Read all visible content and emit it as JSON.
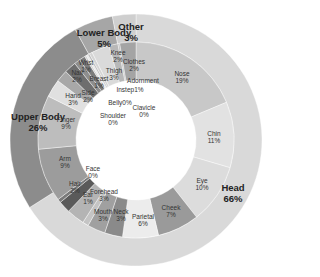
{
  "chart_data": {
    "type": "sunburst",
    "title": "",
    "start_angle_deg": 0,
    "direction": "clockwise",
    "outer": [
      {
        "name": "Head",
        "value": 66,
        "label": "66%",
        "color": "#d9d9d9"
      },
      {
        "name": "Upper Body",
        "value": 26,
        "label": "26%",
        "color": "#8c8c8c"
      },
      {
        "name": "Lower Body",
        "value": 5,
        "label": "5%",
        "color": "#a6a6a6"
      },
      {
        "name": "Other",
        "value": 3,
        "label": "3%",
        "color": "#cfcfcf"
      }
    ],
    "inner": [
      {
        "name": "Nose",
        "value": 19,
        "label": "19%",
        "parent": "Head",
        "color": "#c8c8c8"
      },
      {
        "name": "Chin",
        "value": 11,
        "label": "11%",
        "parent": "Head",
        "color": "#e2e2e2"
      },
      {
        "name": "Eye",
        "value": 10,
        "label": "10%",
        "parent": "Head",
        "color": "#dcdcdc"
      },
      {
        "name": "Cheek",
        "value": 7,
        "label": "7%",
        "parent": "Head",
        "color": "#9a9a9a"
      },
      {
        "name": "Parietal",
        "value": 6,
        "label": "6%",
        "parent": "Head",
        "color": "#ececec"
      },
      {
        "name": "Neck",
        "value": 3,
        "label": "3%",
        "parent": "Head",
        "color": "#8a8a8a"
      },
      {
        "name": "Mouth",
        "value": 3,
        "label": "3%",
        "parent": "Head",
        "color": "#a0a0a0"
      },
      {
        "name": "Ear",
        "value": 1,
        "label": "1%",
        "parent": "Head",
        "color": "#c4c4c4"
      },
      {
        "name": "Forehead",
        "value": 3,
        "label": "3%",
        "parent": "Head",
        "color": "#b4b4b4"
      },
      {
        "name": "Hair",
        "value": 2,
        "label": "2%",
        "parent": "Head",
        "color": "#5a5a5a"
      },
      {
        "name": "Face",
        "value": 0.6,
        "label": "0%",
        "parent": "Head",
        "color": "#7a7a7a"
      },
      {
        "name": "Arm",
        "value": 9,
        "label": "9%",
        "parent": "Upper Body",
        "color": "#9c9c9c"
      },
      {
        "name": "Finger",
        "value": 9,
        "label": "9%",
        "parent": "Upper Body",
        "color": "#bdbdbd"
      },
      {
        "name": "Hand",
        "value": 3,
        "label": "3%",
        "parent": "Upper Body",
        "color": "#e0e0e0"
      },
      {
        "name": "Side",
        "value": 2,
        "label": "2%",
        "parent": "Upper Body",
        "color": "#a8a8a8"
      },
      {
        "name": "Nail",
        "value": 2,
        "label": "2%",
        "parent": "Upper Body",
        "color": "#6e6e6e"
      },
      {
        "name": "Wrist",
        "value": 1,
        "label": "1%",
        "parent": "Upper Body",
        "color": "#8e8e8e"
      },
      {
        "name": "Breast",
        "value": 1,
        "label": "1%",
        "parent": "Upper Body",
        "color": "#7c7c7c"
      },
      {
        "name": "Shoulder",
        "value": 0.3,
        "label": "0%",
        "parent": "Upper Body",
        "color": "#d0d0d0"
      },
      {
        "name": "Clavicle",
        "value": 0.3,
        "label": "0%",
        "parent": "Upper Body",
        "color": "#e8e8e8"
      },
      {
        "name": "Belly",
        "value": 0.3,
        "label": "0%",
        "parent": "Upper Body",
        "color": "#bbbbbb"
      },
      {
        "name": "Instep",
        "value": 0.5,
        "label": "1%",
        "parent": "Lower Body",
        "color": "#d4d4d4"
      },
      {
        "name": "Thigh",
        "value": 3,
        "label": "3%",
        "parent": "Lower Body",
        "color": "#dadada"
      },
      {
        "name": "Knee",
        "value": 1.5,
        "label": "2%",
        "parent": "Lower Body",
        "color": "#b8b8b8"
      },
      {
        "name": "Adornment",
        "value": 0.3,
        "label": "0%",
        "parent": "Other",
        "color": "#c0c0c0"
      },
      {
        "name": "Clothes",
        "value": 2.7,
        "label": "2%",
        "parent": "Other",
        "color": "#a4a4a4"
      }
    ]
  },
  "labels": {
    "head": {
      "name": "Head",
      "pct": "66%"
    },
    "upper_body": {
      "name": "Upper Body",
      "pct": "26%"
    },
    "lower_body": {
      "name": "Lower Body",
      "pct": "5%"
    },
    "other": {
      "name": "Other",
      "pct": "3%"
    },
    "nose": {
      "name": "Nose",
      "pct": "19%"
    },
    "chin": {
      "name": "Chin",
      "pct": "11%"
    },
    "eye": {
      "name": "Eye",
      "pct": "10%"
    },
    "cheek": {
      "name": "Cheek",
      "pct": "7%"
    },
    "parietal": {
      "name": "Parietal",
      "pct": "6%"
    },
    "neck": {
      "name": "Neck",
      "pct": "3%"
    },
    "mouth": {
      "name": "Mouth",
      "pct": "3%"
    },
    "ear": {
      "name": "Ear",
      "pct": "1%"
    },
    "forehead": {
      "name": "Forehead",
      "pct": "3%"
    },
    "hair": {
      "name": "Hair",
      "pct": "2%"
    },
    "face": {
      "name": "Face",
      "pct": "0%"
    },
    "arm": {
      "name": "Arm",
      "pct": "9%"
    },
    "finger": {
      "name": "Finger",
      "pct": "9%"
    },
    "hand": {
      "name": "Hand",
      "pct": "3%"
    },
    "side": {
      "name": "Side",
      "pct": "2%"
    },
    "nail": {
      "name": "Nail",
      "pct": "2%"
    },
    "wrist": {
      "name": "Wrist",
      "pct": "1%"
    },
    "breast": {
      "name": "Breast",
      "pct": "1%"
    },
    "shoulder": {
      "name": "Shoulder",
      "pct": "0%"
    },
    "clavicle": {
      "name": "Clavicle",
      "pct": "0%"
    },
    "belly": {
      "name": "Belly",
      "pct": "0%"
    },
    "instep": {
      "name": "Instep",
      "pct": "1%"
    },
    "thigh": {
      "name": "Thigh",
      "pct": "3%"
    },
    "knee": {
      "name": "Knee",
      "pct": "2%"
    },
    "adornment": {
      "name": "Adornment",
      "pct": "0%"
    },
    "clothes": {
      "name": "Clothes",
      "pct": "2%"
    }
  }
}
